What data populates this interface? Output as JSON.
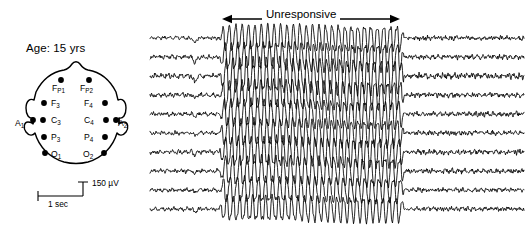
{
  "figure": {
    "width": 528,
    "height": 227,
    "background": "#ffffff",
    "ink_color": "#000000"
  },
  "patient": {
    "age_label": "Age: 15 yrs"
  },
  "annotation": {
    "label": "Unresponsive",
    "arrow_style": "double-headed",
    "arrow_left_x": 222,
    "arrow_right_x": 400,
    "arrow_y": 19
  },
  "head_diagram": {
    "title": "10-20 electrode montage",
    "electrodes": [
      {
        "name": "Fp1",
        "base": "F",
        "sub": "P1",
        "label_x": 38,
        "label_y": 33,
        "dot_x": 47,
        "dot_y": 22,
        "side": "left"
      },
      {
        "name": "Fp2",
        "base": "F",
        "sub": "P2",
        "label_x": 66,
        "label_y": 33,
        "dot_x": 75,
        "dot_y": 22,
        "side": "right"
      },
      {
        "name": "F3",
        "base": "F",
        "sub": "3",
        "label_x": 37,
        "label_y": 48,
        "dot_x": 30,
        "dot_y": 45,
        "side": "left"
      },
      {
        "name": "F4",
        "base": "F",
        "sub": "4",
        "label_x": 70,
        "label_y": 48,
        "dot_x": 91,
        "dot_y": 45,
        "side": "right"
      },
      {
        "name": "C3",
        "base": "C",
        "sub": "3",
        "label_x": 37,
        "label_y": 65,
        "dot_x": 29,
        "dot_y": 62,
        "side": "left"
      },
      {
        "name": "C4",
        "base": "C",
        "sub": "4",
        "label_x": 70,
        "label_y": 65,
        "dot_x": 92,
        "dot_y": 62,
        "side": "right"
      },
      {
        "name": "P3",
        "base": "P",
        "sub": "3",
        "label_x": 37,
        "label_y": 82,
        "dot_x": 30,
        "dot_y": 79,
        "side": "left"
      },
      {
        "name": "P4",
        "base": "P",
        "sub": "4",
        "label_x": 70,
        "label_y": 82,
        "dot_x": 91,
        "dot_y": 79,
        "side": "right"
      },
      {
        "name": "O1",
        "base": "O",
        "sub": "1",
        "label_x": 37,
        "label_y": 99,
        "dot_x": 31,
        "dot_y": 95,
        "side": "left"
      },
      {
        "name": "O2",
        "base": "O",
        "sub": "2",
        "label_x": 69,
        "label_y": 99,
        "dot_x": 90,
        "dot_y": 95,
        "side": "right"
      }
    ],
    "ear_electrodes": [
      {
        "name": "A1",
        "base": "A",
        "sub": "1",
        "label_x": 1,
        "label_y": 68,
        "dot_x": 19,
        "dot_y": 62,
        "side": "left"
      },
      {
        "name": "A2",
        "base": "A",
        "sub": "2",
        "label_x": 104,
        "label_y": 68,
        "dot_x": 102,
        "dot_y": 62,
        "side": "right"
      }
    ]
  },
  "scale_bar": {
    "vertical_label": "150 µV",
    "horizontal_label": "1 sec",
    "vertical_amplitude_uv": 150,
    "horizontal_duration_sec": 1
  },
  "chart_data": {
    "type": "line",
    "xlabel": "Time",
    "ylabel": "Channel",
    "grid": false,
    "legend": "none",
    "n_channels": 10,
    "x_range_px": [
      150,
      524
    ],
    "channel_spacing_px": 19,
    "first_channel_y_px": 38,
    "events": [
      {
        "name": "Unresponsive",
        "onset_x_px": 219,
        "offset_x_px": 404,
        "description": "High-amplitude rhythmic generalized spike activity across all channels"
      }
    ],
    "segments": [
      {
        "phase": "pre-ictal baseline",
        "x_start_px": 150,
        "x_end_px": 219,
        "amplitude_px": 2.2,
        "frequency_hz": 9,
        "character": "low-amplitude irregular background"
      },
      {
        "phase": "ictal discharge",
        "x_start_px": 219,
        "x_end_px": 404,
        "amplitude_px": 12.5,
        "frequency_hz": 3.2,
        "character": "high-amplitude rhythmic sharp waves"
      },
      {
        "phase": "post-ictal baseline",
        "x_start_px": 404,
        "x_end_px": 524,
        "amplitude_px": 2.4,
        "frequency_hz": 9,
        "character": "low-amplitude irregular background, slight attenuation"
      }
    ]
  }
}
